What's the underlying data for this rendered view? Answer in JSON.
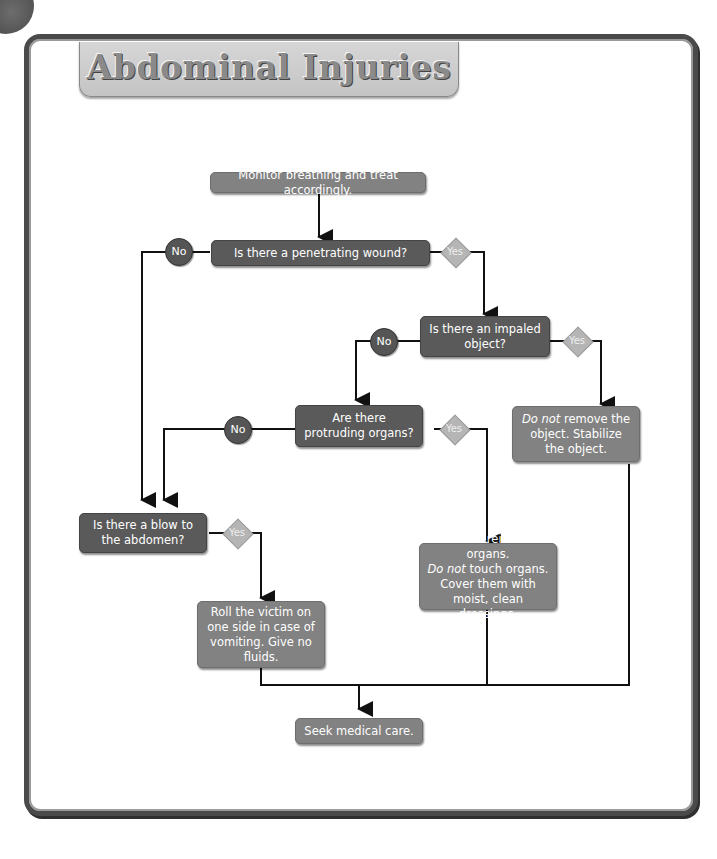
{
  "title": "Abdominal Injuries",
  "labels": {
    "yes": "Yes",
    "no": "No"
  },
  "nodes": {
    "monitor": "Monitor breathing and treat accordingly.",
    "penetrating": "Is there a penetrating wound?",
    "impaled": "Is there an impaled object?",
    "protruding": "Are there protruding organs?",
    "dont_remove_1": "Do not",
    "dont_remove_2": " remove the object. Stabilize the object.",
    "blow": "Is there a blow to the abdomen?",
    "organs_a1": "Do not",
    "organs_a2": " reinsert organs.",
    "organs_b1": "Do not",
    "organs_b2": " touch organs.",
    "organs_c": "Cover them with moist, clean dressings.",
    "roll": "Roll the victim on one side in case of vomiting. Give no fluids.",
    "seek": "Seek medical care."
  },
  "colors": {
    "action_box": "#828282",
    "question_box": "#5a5a5a",
    "yes_diamond": "#b5b5b5",
    "no_circle": "#555555",
    "frame": "#4a4a4a"
  }
}
